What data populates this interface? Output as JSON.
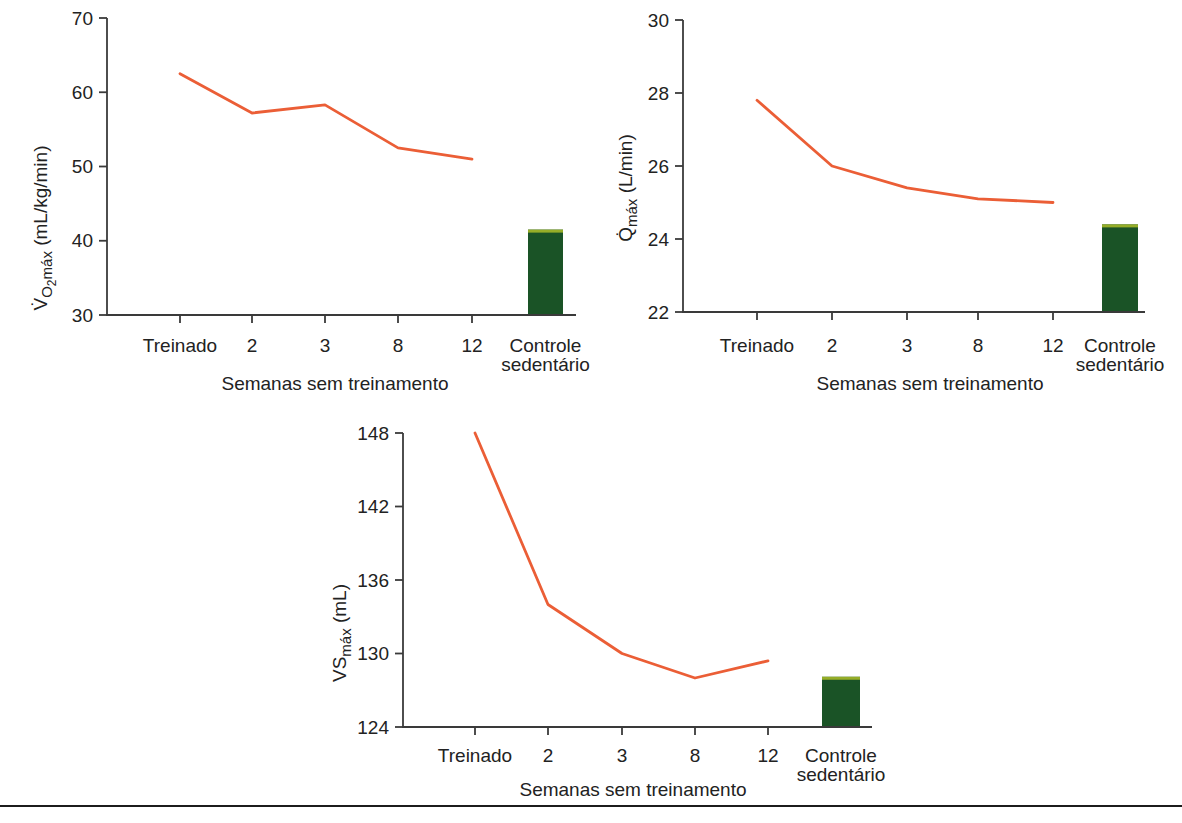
{
  "figure": {
    "kind": "textbook-detraining-figure",
    "language": "pt-BR"
  },
  "colors": {
    "line": "#eb5e36",
    "bar": "#1a5326",
    "bar_cap": "#96ad28",
    "axis": "#3a3a3a",
    "text": "#222222",
    "rule": "#1c1c1c"
  },
  "chart_data": [
    {
      "id": "vo2max",
      "type": "line+bar",
      "ylabel_text": "V̇O2máx (mL/kg/min)",
      "ylabel_parts": [
        {
          "text": "V̇",
          "style": "normal"
        },
        {
          "text": "O",
          "style": "sub"
        },
        {
          "text": "2",
          "style": "subsub"
        },
        {
          "text": "máx",
          "style": "sub"
        },
        {
          "text": " (mL/kg/min)",
          "style": "normal"
        }
      ],
      "ylim": [
        30,
        70
      ],
      "yticks": [
        30,
        40,
        50,
        60,
        70
      ],
      "categories": [
        "Treinado",
        "2",
        "3",
        "8",
        "12"
      ],
      "line_values": [
        62.5,
        57.2,
        58.3,
        52.5,
        51.0
      ],
      "control_bar": {
        "label_line1": "Controle",
        "label_line2": "sedentário",
        "value": 41.5
      },
      "xlabel": "Semanas sem treinamento"
    },
    {
      "id": "qmax",
      "type": "line+bar",
      "ylabel_text": "Q̇máx (L/min)",
      "ylabel_parts": [
        {
          "text": "Q̇",
          "style": "normal"
        },
        {
          "text": "máx",
          "style": "sub"
        },
        {
          "text": " (L/min)",
          "style": "normal"
        }
      ],
      "ylim": [
        22,
        30
      ],
      "yticks": [
        22,
        24,
        26,
        28,
        30
      ],
      "categories": [
        "Treinado",
        "2",
        "3",
        "8",
        "12"
      ],
      "line_values": [
        27.8,
        26.0,
        25.4,
        25.1,
        25.0
      ],
      "control_bar": {
        "label_line1": "Controle",
        "label_line2": "sedentário",
        "value": 24.4
      },
      "xlabel": "Semanas sem treinamento"
    },
    {
      "id": "vsmax",
      "type": "line+bar",
      "ylabel_text": "VSmáx (mL)",
      "ylabel_parts": [
        {
          "text": "VS",
          "style": "normal"
        },
        {
          "text": "máx",
          "style": "sub"
        },
        {
          "text": " (mL)",
          "style": "normal"
        }
      ],
      "ylim": [
        124,
        148
      ],
      "yticks": [
        124,
        130,
        136,
        142,
        148
      ],
      "categories": [
        "Treinado",
        "2",
        "3",
        "8",
        "12"
      ],
      "line_values": [
        148,
        134,
        130,
        128,
        129.4
      ],
      "control_bar": {
        "label_line1": "Controle",
        "label_line2": "sedentário",
        "value": 128.1
      },
      "xlabel": "Semanas sem treinamento"
    }
  ]
}
